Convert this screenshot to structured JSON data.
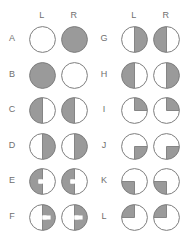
{
  "figure": {
    "colors": {
      "shaded": "#9a9a9a",
      "unshaded": "#ffffff",
      "outline": "#7d7d7d",
      "label_text": "#6f6f6f",
      "background": "#ffffff"
    },
    "column_headers": {
      "left": "L",
      "right": "R"
    },
    "panels": [
      {
        "name": "panel-left",
        "headers": {
          "left": "L",
          "right": "R"
        },
        "rows": [
          {
            "label": "A",
            "left": {
              "pattern": "full",
              "notch": false
            },
            "right": {
              "pattern": "empty",
              "notch": false
            }
          },
          {
            "label": "B",
            "left": {
              "pattern": "full",
              "notch": false
            },
            "right": {
              "pattern": "empty",
              "notch": false
            }
          },
          {
            "label": "C",
            "left": {
              "pattern": "half-left",
              "notch": false
            },
            "right": {
              "pattern": "half-left",
              "notch": false
            }
          },
          {
            "label": "D",
            "left": {
              "pattern": "half-right",
              "notch": false
            },
            "right": {
              "pattern": "half-right",
              "notch": false
            }
          },
          {
            "label": "E",
            "left": {
              "pattern": "half-left",
              "notch": true
            },
            "right": {
              "pattern": "half-left",
              "notch": true
            }
          },
          {
            "label": "F",
            "left": {
              "pattern": "half-right",
              "notch": true
            },
            "right": {
              "pattern": "half-right",
              "notch": true
            }
          }
        ]
      },
      {
        "name": "panel-right",
        "headers": {
          "left": "L",
          "right": "R"
        },
        "rows": [
          {
            "label": "G",
            "left": {
              "pattern": "half-right",
              "notch": false
            },
            "right": {
              "pattern": "half-left",
              "notch": false
            }
          },
          {
            "label": "H",
            "left": {
              "pattern": "half-left",
              "notch": false
            },
            "right": {
              "pattern": "half-right",
              "notch": false
            }
          },
          {
            "label": "I",
            "left": {
              "pattern": "quad-ur",
              "notch": false
            },
            "right": {
              "pattern": "quad-ur",
              "notch": false
            }
          },
          {
            "label": "J",
            "left": {
              "pattern": "quad-lr",
              "notch": false
            },
            "right": {
              "pattern": "quad-lr",
              "notch": false
            }
          },
          {
            "label": "K",
            "left": {
              "pattern": "quad-ll",
              "notch": false
            },
            "right": {
              "pattern": "quad-ll",
              "notch": false
            }
          },
          {
            "label": "L",
            "left": {
              "pattern": "quad-ul",
              "notch": false
            },
            "right": {
              "pattern": "quad-ul",
              "notch": false
            }
          }
        ]
      }
    ],
    "row_a_override": {
      "note": "Row A left disc is unshaded and right disc is fully shaded",
      "left": "empty",
      "right": "full"
    },
    "layout": {
      "rows_per_panel": 12,
      "row_top_start": 24,
      "row_pitch": 35.5,
      "disc_diameter": 27
    }
  }
}
